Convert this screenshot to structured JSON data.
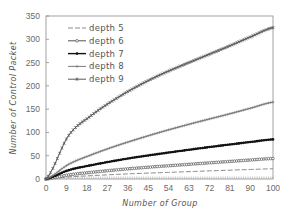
{
  "chart_data": {
    "type": "line",
    "title": "",
    "xlabel": "Number of Group",
    "ylabel": "Number of Control Packet",
    "xlim": [
      0,
      100
    ],
    "ylim": [
      0,
      350
    ],
    "x_ticks": [
      0,
      9,
      18,
      27,
      36,
      45,
      54,
      63,
      72,
      81,
      90,
      100
    ],
    "y_ticks": [
      0,
      50,
      100,
      150,
      200,
      250,
      300,
      350
    ],
    "grid": false,
    "legend_position": "upper left",
    "x": [
      0,
      10,
      20,
      30,
      40,
      50,
      60,
      70,
      80,
      90,
      100
    ],
    "series": [
      {
        "name": "depth 5",
        "style": "dashed",
        "marker": "none",
        "color": "#8a8a8a",
        "values": [
          0,
          4.4,
          7.2,
          9.6,
          11.8,
          13.5,
          15.3,
          17.1,
          18.8,
          20.4,
          22
        ]
      },
      {
        "name": "depth 6",
        "style": "solid",
        "marker": "open-circle",
        "color": "#555555",
        "values": [
          0,
          8.8,
          14.3,
          19.1,
          23.4,
          27.1,
          30.5,
          34.0,
          37.4,
          40.8,
          44
        ]
      },
      {
        "name": "depth 7",
        "style": "solid",
        "marker": "filled-circle",
        "color": "#111111",
        "values": [
          0,
          19.0,
          29.7,
          38.9,
          47.0,
          54.0,
          60.8,
          67.3,
          73.5,
          79.4,
          85
        ]
      },
      {
        "name": "depth 8",
        "style": "solid",
        "marker": "plus",
        "color": "#7a7a7a",
        "values": [
          0,
          31.6,
          52.0,
          69.6,
          85.3,
          100.0,
          113.6,
          126.4,
          138.8,
          151.9,
          165
        ]
      },
      {
        "name": "depth 9",
        "style": "solid",
        "marker": "star",
        "color": "#5a5a5a",
        "values": [
          0,
          93.6,
          136.5,
          170.0,
          198.5,
          223.0,
          244.0,
          264.0,
          284.0,
          305.0,
          325
        ]
      }
    ]
  }
}
